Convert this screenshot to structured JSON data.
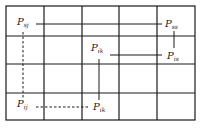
{
  "diagram": {
    "type": "grid-diagram",
    "grid": {
      "columns": 5,
      "rows": 4,
      "x_lines": [
        6,
        44,
        82,
        119,
        157,
        195
      ],
      "y_lines": [
        6,
        36,
        64,
        93,
        120
      ]
    },
    "colors": {
      "line": "#1a1a1a",
      "background": "#ffffff"
    },
    "nodes": [
      {
        "id": "sj",
        "base": "P",
        "sub": "sj",
        "x": 17,
        "y": 25
      },
      {
        "id": "ss",
        "base": "P",
        "sub": "ss",
        "x": 165,
        "y": 27
      },
      {
        "id": "ik_top",
        "base": "P",
        "sub": "ik",
        "x": 91,
        "y": 51
      },
      {
        "id": "is",
        "base": "P",
        "sub": "is",
        "x": 167,
        "y": 59
      },
      {
        "id": "ij",
        "base": "P",
        "sub": "ij",
        "x": 17,
        "y": 107
      },
      {
        "id": "ik_bottom",
        "base": "P",
        "sub": "ik",
        "x": 93,
        "y": 110
      }
    ],
    "connections": [
      {
        "from": "sj",
        "to": "ss",
        "style": "solid"
      },
      {
        "from": "ss",
        "to": "is",
        "style": "solid"
      },
      {
        "from": "ik_top",
        "to": "is",
        "style": "solid"
      },
      {
        "from": "ik_top",
        "to": "ik_bottom",
        "style": "solid"
      },
      {
        "from": "ij",
        "to": "ik_bottom",
        "style": "dashed"
      },
      {
        "from": "ij",
        "to": "sj",
        "style": "dashed"
      }
    ]
  }
}
